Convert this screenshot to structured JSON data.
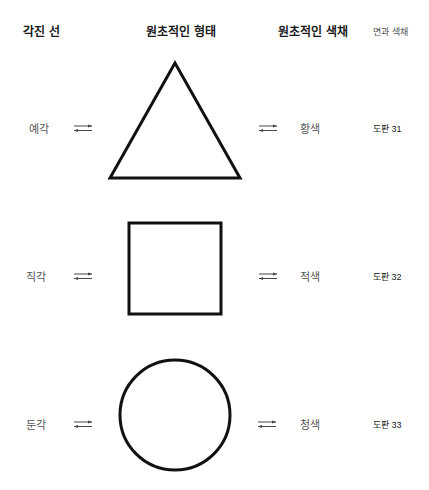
{
  "headers": {
    "angled_lines": "각진 선",
    "primary_shapes": "원초적인 형태",
    "primary_colors": "원초적인 색채",
    "face_and_color": "면과 색채"
  },
  "rows": [
    {
      "angle": "예각",
      "shape": "triangle",
      "color": "황색",
      "plate": "도판 31"
    },
    {
      "angle": "직각",
      "shape": "square",
      "color": "적색",
      "plate": "도판 32"
    },
    {
      "angle": "둔각",
      "shape": "circle",
      "color": "청색",
      "plate": "도판 33"
    }
  ],
  "icons": {
    "arrow": "bidirectional-arrow"
  },
  "colors": {
    "stroke": "#111111",
    "background": "#ffffff"
  }
}
